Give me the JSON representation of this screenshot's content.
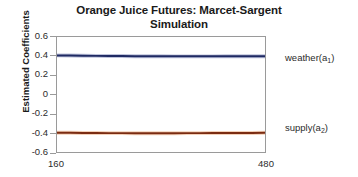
{
  "chart_data": {
    "type": "line",
    "title": "Orange Juice Futures: Marcet-Sargent Simulation",
    "title_line1": "Orange Juice Futures: Marcet-Sargent",
    "title_line2": "Simulation",
    "xlabel": "",
    "ylabel": "Estimated Coefficients",
    "xlim": [
      160,
      480
    ],
    "ylim": [
      -0.6,
      0.6
    ],
    "yticks": [
      0.6,
      0.4,
      0.2,
      0,
      -0.2,
      -0.4,
      -0.6
    ],
    "ytick_labels": [
      "0.6",
      "0.4",
      "0.2",
      "0",
      "-0.2",
      "-0.4",
      "-0.6"
    ],
    "xticks": [
      160,
      480
    ],
    "xtick_labels": [
      "160",
      "480"
    ],
    "grid": false,
    "legend_position": "right-inline",
    "series": [
      {
        "name": "weather(a1)",
        "label": "weather(a",
        "label_sub": "1",
        "label_suffix": ")",
        "color": "#1f2a63",
        "halo_color": "#6f7bb0",
        "level": 0.4,
        "x": [
          160,
          180,
          200,
          220,
          240,
          260,
          280,
          300,
          320,
          340,
          360,
          380,
          400,
          420,
          440,
          460,
          480
        ],
        "values": [
          0.408,
          0.406,
          0.404,
          0.403,
          0.402,
          0.401,
          0.4,
          0.399,
          0.399,
          0.398,
          0.398,
          0.398,
          0.398,
          0.399,
          0.399,
          0.4,
          0.4
        ]
      },
      {
        "name": "supply(a2)",
        "label": "supply(a",
        "label_sub": "2",
        "label_suffix": ")",
        "color": "#7b2c12",
        "halo_color": "#e79a63",
        "level": -0.4,
        "x": [
          160,
          180,
          200,
          220,
          240,
          260,
          280,
          300,
          320,
          340,
          360,
          380,
          400,
          420,
          440,
          460,
          480
        ],
        "values": [
          -0.4,
          -0.4,
          -0.401,
          -0.402,
          -0.403,
          -0.403,
          -0.404,
          -0.404,
          -0.404,
          -0.404,
          -0.403,
          -0.403,
          -0.402,
          -0.402,
          -0.401,
          -0.401,
          -0.4
        ]
      }
    ]
  },
  "axes": {
    "y_title": "Estimated Coefficients",
    "y_labels": [
      "0.6",
      "0.4",
      "0.2",
      "0",
      "-0.2",
      "-0.4",
      "-0.6"
    ],
    "x_labels": [
      "160",
      "480"
    ]
  }
}
